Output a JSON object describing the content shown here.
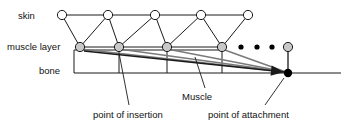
{
  "diagram": {
    "labels": {
      "skin": "skin",
      "muscle_layer": "muscle layer",
      "bone": "bone",
      "point_of_insertion": "point of insertion",
      "muscle": "Muscle",
      "point_of_attachment": "point of attachment"
    },
    "colors": {
      "stroke": "#1a1a1a",
      "muscle_fiber": "#7a7a7a",
      "node_fill_skin": "#ffffff",
      "node_fill_muscle": "#c8c8c8",
      "node_fill_attachment": "#000000",
      "text": "#111111"
    },
    "nodes": {
      "skin": [
        {
          "x": 62,
          "y": 15,
          "r": 4.6
        },
        {
          "x": 108,
          "y": 15,
          "r": 4.6
        },
        {
          "x": 155,
          "y": 15,
          "r": 4.6
        },
        {
          "x": 201,
          "y": 15,
          "r": 4.6
        },
        {
          "x": 248,
          "y": 15,
          "r": 4.6
        }
      ],
      "muscle": [
        {
          "x": 80,
          "y": 47,
          "r": 4.6
        },
        {
          "x": 119,
          "y": 47,
          "r": 4.6
        },
        {
          "x": 167,
          "y": 47,
          "r": 4.6
        },
        {
          "x": 222,
          "y": 47,
          "r": 4.6
        }
      ],
      "ellipsis": [
        {
          "x": 241,
          "y": 47,
          "r": 2.6
        },
        {
          "x": 257,
          "y": 47,
          "r": 2.6
        },
        {
          "x": 272,
          "y": 47,
          "r": 2.6
        }
      ],
      "far_muscle": {
        "x": 288,
        "y": 47,
        "r": 4.6
      },
      "attachment": {
        "x": 288,
        "y": 73,
        "r": 4.2
      }
    },
    "mesh_edges": [
      {
        "x1": 62,
        "y1": 15,
        "x2": 108,
        "y2": 15
      },
      {
        "x1": 108,
        "y1": 15,
        "x2": 155,
        "y2": 15
      },
      {
        "x1": 155,
        "y1": 15,
        "x2": 201,
        "y2": 15
      },
      {
        "x1": 201,
        "y1": 15,
        "x2": 248,
        "y2": 15
      },
      {
        "x1": 62,
        "y1": 15,
        "x2": 80,
        "y2": 47
      },
      {
        "x1": 108,
        "y1": 15,
        "x2": 80,
        "y2": 47
      },
      {
        "x1": 108,
        "y1": 15,
        "x2": 119,
        "y2": 47
      },
      {
        "x1": 155,
        "y1": 15,
        "x2": 119,
        "y2": 47
      },
      {
        "x1": 155,
        "y1": 15,
        "x2": 167,
        "y2": 47
      },
      {
        "x1": 201,
        "y1": 15,
        "x2": 167,
        "y2": 47
      },
      {
        "x1": 201,
        "y1": 15,
        "x2": 222,
        "y2": 47
      },
      {
        "x1": 248,
        "y1": 15,
        "x2": 222,
        "y2": 47
      },
      {
        "x1": 80,
        "y1": 47,
        "x2": 119,
        "y2": 47
      },
      {
        "x1": 119,
        "y1": 47,
        "x2": 167,
        "y2": 47
      },
      {
        "x1": 167,
        "y1": 47,
        "x2": 222,
        "y2": 47
      }
    ],
    "bone": {
      "top_y": 50,
      "bottom_y": 73,
      "left_x": 74,
      "line_right_x": 341,
      "verticals": [
        74,
        119,
        167,
        222
      ]
    },
    "muscle_fibers": [
      {
        "x1": 80,
        "y1": 49,
        "x2": 286,
        "y2": 72
      },
      {
        "x1": 119,
        "y1": 49,
        "x2": 286,
        "y2": 72
      },
      {
        "x1": 167,
        "y1": 49,
        "x2": 286,
        "y2": 72
      },
      {
        "x1": 222,
        "y1": 49,
        "x2": 286,
        "y2": 72
      }
    ],
    "arrow": {
      "x1": 84,
      "y1": 51,
      "x2": 284,
      "y2": 72
    },
    "leaders": [
      {
        "x1": 119,
        "y1": 53,
        "x2": 129,
        "y2": 105,
        "target": "point_of_insertion"
      },
      {
        "x1": 195,
        "y1": 57,
        "x2": 205,
        "y2": 88,
        "target": "muscle"
      },
      {
        "x1": 284,
        "y1": 78,
        "x2": 265,
        "y2": 105,
        "target": "point_of_attachment"
      }
    ]
  }
}
